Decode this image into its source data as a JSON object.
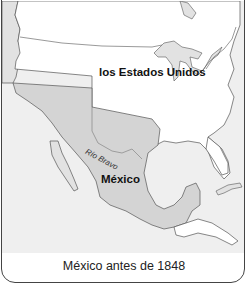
{
  "map": {
    "title": "México antes de 1848",
    "labels": {
      "united_states": "los Estados Unidos",
      "mexico": "México",
      "river": "Río Bravo"
    },
    "colors": {
      "ocean": "#efefef",
      "us_land": "#ffffff",
      "mexico_land": "#d4d4d4",
      "other_land": "#e2e2e2",
      "border": "#444444"
    }
  }
}
